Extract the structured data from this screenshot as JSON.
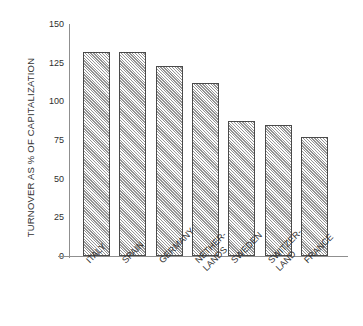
{
  "chart_data": {
    "type": "bar",
    "title": "",
    "xlabel": "",
    "ylabel": "TURNOVER AS % OF CAPITALIZATION",
    "ylim": [
      0,
      150
    ],
    "ytick_values": [
      0,
      25,
      50,
      75,
      100,
      125,
      150
    ],
    "ytick_labels": [
      "0",
      "25",
      "50",
      "75",
      "100",
      "125",
      "150"
    ],
    "grid": false,
    "legend": null,
    "categories": [
      "ITALY",
      "SPAIN",
      "GERMANY",
      "NETHER-LANDS",
      "SWEDEN",
      "SWITZER-LAND",
      "FRANCE"
    ],
    "category_lines": [
      [
        "ITALY",
        ""
      ],
      [
        "SPAIN",
        ""
      ],
      [
        "GERMANY",
        ""
      ],
      [
        "NETHER-",
        "LANDS"
      ],
      [
        "SWEDEN",
        ""
      ],
      [
        "SWITZER-",
        "LAND"
      ],
      [
        "FRANCE",
        ""
      ]
    ],
    "values": [
      132,
      132,
      123,
      112,
      87,
      85,
      77
    ],
    "bar_style": {
      "fill": "#dcdcdc",
      "hatch": "diagonal",
      "edge": "#4a4a4a"
    },
    "axis_color": "#8f8f8f",
    "background": "#ffffff"
  }
}
